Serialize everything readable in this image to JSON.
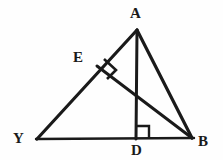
{
  "figure": {
    "background_color": "#fefefe",
    "stroke_color": "#1a1a1a",
    "labels": {
      "apex": "A",
      "foot_on_side_YA": "E",
      "left_base_vertex": "Y",
      "foot_on_base": "D",
      "right_base_vertex": "B"
    },
    "points": {
      "A": {
        "x": 137,
        "y": 30
      },
      "E": {
        "x": 97,
        "y": 66
      },
      "Y": {
        "x": 37,
        "y": 139
      },
      "D": {
        "x": 137,
        "y": 138
      },
      "B": {
        "x": 192,
        "y": 138
      }
    },
    "segments": [
      {
        "name": "side-YA",
        "from": "Y",
        "to": "A",
        "width": 3.2
      },
      {
        "name": "side-AB",
        "from": "A",
        "to": "B",
        "width": 3.2
      },
      {
        "name": "base-YB",
        "from": "Y",
        "to": "B",
        "width": 2.4
      },
      {
        "name": "altitude-AD",
        "from": "A",
        "to": "D",
        "width": 3.0
      },
      {
        "name": "altitude-BE",
        "from": "B",
        "to": "E",
        "width": 3.0
      }
    ],
    "right_angles": [
      {
        "name": "right-angle-at-E",
        "vertex": "E",
        "size": 13
      },
      {
        "name": "right-angle-at-D",
        "vertex": "D",
        "size": 12
      }
    ]
  }
}
